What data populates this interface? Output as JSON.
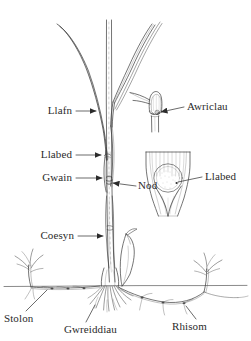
{
  "figure": {
    "type": "botanical-diagram",
    "language": "Welsh",
    "background_color": "#ffffff",
    "ink_color": "#3a3a3a",
    "width": 251,
    "height": 341
  },
  "labels": [
    {
      "id": "llafn",
      "text": "Llafn",
      "x": 72,
      "y": 114,
      "align": "right",
      "leader": "arrow-right"
    },
    {
      "id": "llabed",
      "text": "Llabed",
      "x": 72,
      "y": 158,
      "align": "right",
      "leader": "arrow-right"
    },
    {
      "id": "gwain",
      "text": "Gwain",
      "x": 72,
      "y": 181,
      "align": "right",
      "leader": "arrow-right"
    },
    {
      "id": "nod",
      "text": "Nod",
      "x": 120,
      "y": 185,
      "align": "left",
      "leader": "arrow-left"
    },
    {
      "id": "coesyn",
      "text": "Coesyn",
      "x": 72,
      "y": 239,
      "align": "right",
      "leader": "arrow-right"
    },
    {
      "id": "awriclau",
      "text": "Awriclau",
      "x": 188,
      "y": 110,
      "align": "left",
      "leader": "arrow-left"
    },
    {
      "id": "llabed-2",
      "text": "Llabed",
      "x": 205,
      "y": 180,
      "align": "left",
      "leader": "line-left"
    },
    {
      "id": "stolon",
      "text": "Stolon",
      "x": 4,
      "y": 320,
      "align": "left",
      "leader": "diagonal-up-right"
    },
    {
      "id": "gwreiddiau",
      "text": "Gwreiddiau",
      "x": 64,
      "y": 331,
      "align": "left",
      "leader": "diagonal-up-right"
    },
    {
      "id": "rhisom",
      "text": "Rhisom",
      "x": 172,
      "y": 328,
      "align": "left",
      "leader": "diagonal-up-left"
    }
  ],
  "parts": {
    "blade": "Llafn",
    "ligule": "Llabed",
    "sheath": "Gwain",
    "node": "Nod",
    "stem": "Coesyn",
    "auricles": "Awriclau",
    "stolon": "Stolon",
    "roots": "Gwreiddiau",
    "rhizome": "Rhisom"
  },
  "insets": [
    {
      "id": "auricle-inset",
      "name": "auricle detail",
      "label": "Awriclau"
    },
    {
      "id": "ligule-inset",
      "name": "ligule detail",
      "label": "Llabed"
    }
  ],
  "soil_line": {
    "y": 285,
    "x_start": 4,
    "x_end": 247
  }
}
